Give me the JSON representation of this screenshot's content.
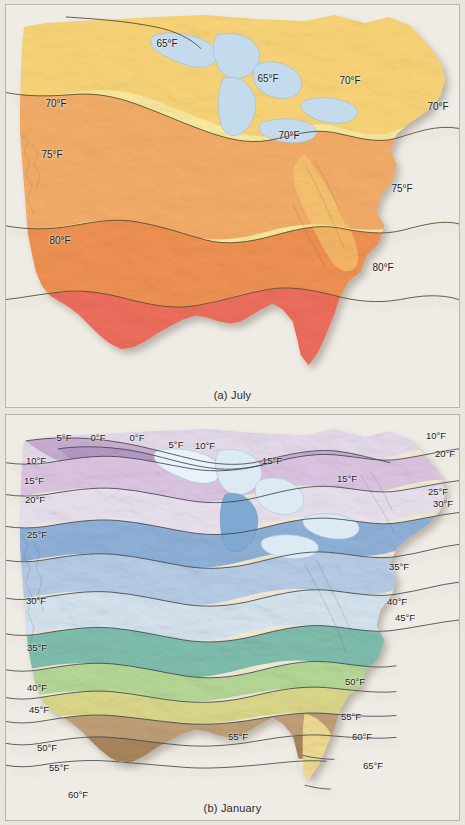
{
  "figure": {
    "background_color": "#e9e6e0",
    "panel_background": "#efece5",
    "panel_border_color": "#b9b5ad",
    "land_outline_color": "#6b5a43",
    "isotherm_color": "#4a4030",
    "lake_color": "#bcd9ec",
    "lake_outline_color": "#8fb4cd",
    "shadow_color": "rgba(120,110,95,0.35)"
  },
  "panels": [
    {
      "id": "july",
      "caption": "(a) July",
      "unit": "°F",
      "band_colors": [
        "#f6e08a",
        "#f7c86a",
        "#f2a862",
        "#ef9355",
        "#ec6a5c"
      ],
      "labels": [
        {
          "text": "65°F",
          "x": 161,
          "y": 39
        },
        {
          "text": "65°F",
          "x": 262,
          "y": 74
        },
        {
          "text": "70°F",
          "x": 344,
          "y": 76
        },
        {
          "text": "70°F",
          "x": 432,
          "y": 102
        },
        {
          "text": "70°F",
          "x": 50,
          "y": 99
        },
        {
          "text": "70°F",
          "x": 283,
          "y": 131
        },
        {
          "text": "75°F",
          "x": 46,
          "y": 150
        },
        {
          "text": "75°F",
          "x": 396,
          "y": 184
        },
        {
          "text": "80°F",
          "x": 54,
          "y": 236
        },
        {
          "text": "80°F",
          "x": 377,
          "y": 263
        }
      ]
    },
    {
      "id": "january",
      "caption": "(b) January",
      "unit": "°F",
      "band_colors": [
        "#c9aed2",
        "#ddc6e3",
        "#eadcee",
        "#8fb0d8",
        "#b6cbe6",
        "#cfe0ee",
        "#e4eef6",
        "#7fbfae",
        "#9ccbb2",
        "#bedb9c",
        "#ddd98a",
        "#c7a878",
        "#ad8a5e",
        "#f3ead3",
        "#f2dc8e",
        "#ebe13f"
      ],
      "labels": [
        {
          "text": "5°F",
          "x": 58,
          "y": 23
        },
        {
          "text": "0°F",
          "x": 92,
          "y": 23
        },
        {
          "text": "0°F",
          "x": 131,
          "y": 23
        },
        {
          "text": "5°F",
          "x": 170,
          "y": 30
        },
        {
          "text": "10°F",
          "x": 199,
          "y": 31
        },
        {
          "text": "10°F",
          "x": 430,
          "y": 21
        },
        {
          "text": "20°F",
          "x": 439,
          "y": 39
        },
        {
          "text": "10°F",
          "x": 30,
          "y": 46
        },
        {
          "text": "15°F",
          "x": 266,
          "y": 46
        },
        {
          "text": "15°F",
          "x": 28,
          "y": 66
        },
        {
          "text": "15°F",
          "x": 341,
          "y": 64
        },
        {
          "text": "20°F",
          "x": 29,
          "y": 85
        },
        {
          "text": "25°F",
          "x": 432,
          "y": 77
        },
        {
          "text": "30°F",
          "x": 437,
          "y": 89
        },
        {
          "text": "25°F",
          "x": 31,
          "y": 120
        },
        {
          "text": "35°F",
          "x": 393,
          "y": 152
        },
        {
          "text": "30°F",
          "x": 30,
          "y": 186
        },
        {
          "text": "40°F",
          "x": 391,
          "y": 187
        },
        {
          "text": "45°F",
          "x": 399,
          "y": 203
        },
        {
          "text": "35°F",
          "x": 31,
          "y": 233
        },
        {
          "text": "40°F",
          "x": 31,
          "y": 273
        },
        {
          "text": "50°F",
          "x": 349,
          "y": 267
        },
        {
          "text": "45°F",
          "x": 33,
          "y": 295
        },
        {
          "text": "55°F",
          "x": 345,
          "y": 302
        },
        {
          "text": "50°F",
          "x": 41,
          "y": 333
        },
        {
          "text": "55°F",
          "x": 232,
          "y": 322
        },
        {
          "text": "60°F",
          "x": 356,
          "y": 322
        },
        {
          "text": "55°F",
          "x": 53,
          "y": 353
        },
        {
          "text": "65°F",
          "x": 367,
          "y": 351
        },
        {
          "text": "60°F",
          "x": 72,
          "y": 380
        }
      ]
    }
  ]
}
